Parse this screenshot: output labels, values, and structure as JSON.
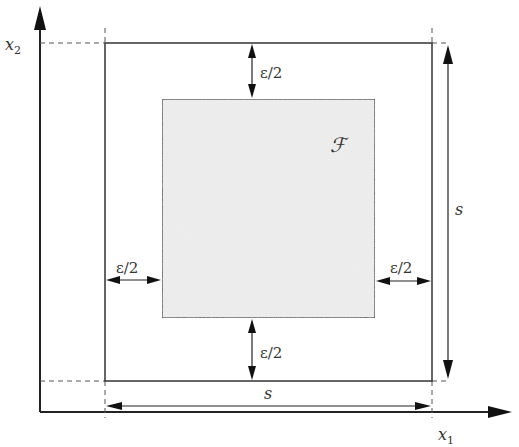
{
  "diagram": {
    "axes": {
      "x_label": "x",
      "x_sub": "1",
      "y_label": "x",
      "y_sub": "2"
    },
    "region": {
      "label": "ℱ",
      "description": "inner shaded square F"
    },
    "margins": {
      "top": "ε/2",
      "bottom": "ε/2",
      "left": "ε/2",
      "right": "ε/2"
    },
    "sides": {
      "horizontal": "s",
      "vertical": "s"
    },
    "colors": {
      "line": "#333333",
      "fill": "#ececec",
      "dash": "#555555"
    }
  }
}
